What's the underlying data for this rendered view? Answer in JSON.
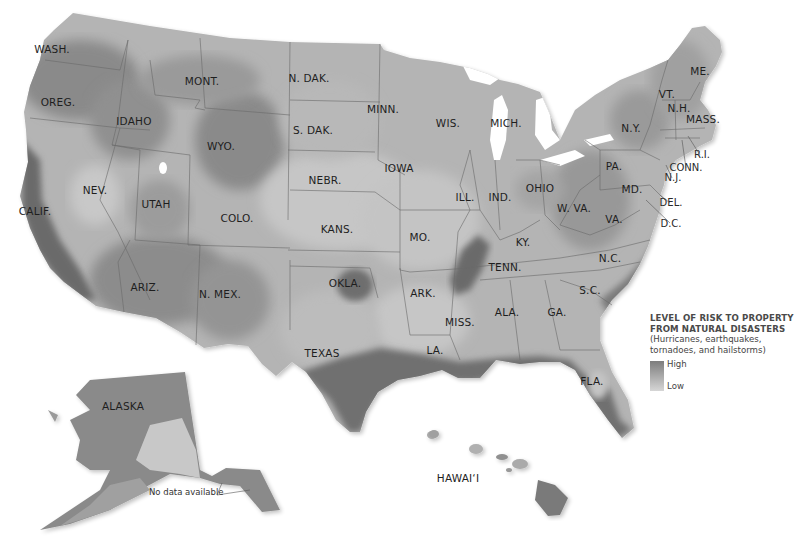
{
  "map": {
    "title": "Level of risk to property from natural disasters",
    "colors": {
      "high": "#6e6e6e",
      "mid": "#a6a6a6",
      "low": "#d8d8d8",
      "water": "#ffffff",
      "border": "#6a6a6a"
    },
    "states": [
      {
        "id": "wash",
        "label": "WASH.",
        "x": 52,
        "y": 53
      },
      {
        "id": "oreg",
        "label": "OREG.",
        "x": 58,
        "y": 106
      },
      {
        "id": "idaho",
        "label": "IDAHO",
        "x": 134,
        "y": 125
      },
      {
        "id": "mont",
        "label": "MONT.",
        "x": 202,
        "y": 85
      },
      {
        "id": "wyo",
        "label": "WYO.",
        "x": 221,
        "y": 150
      },
      {
        "id": "ndak",
        "label": "N. DAK.",
        "x": 309,
        "y": 82
      },
      {
        "id": "sdak",
        "label": "S. DAK.",
        "x": 313,
        "y": 134
      },
      {
        "id": "minn",
        "label": "MINN.",
        "x": 383,
        "y": 113
      },
      {
        "id": "wis",
        "label": "WIS.",
        "x": 448,
        "y": 127
      },
      {
        "id": "mich",
        "label": "MICH.",
        "x": 506,
        "y": 127
      },
      {
        "id": "nev",
        "label": "NEV.",
        "x": 95,
        "y": 194
      },
      {
        "id": "utah",
        "label": "UTAH",
        "x": 156,
        "y": 208
      },
      {
        "id": "calif",
        "label": "CALIF.",
        "x": 35,
        "y": 215
      },
      {
        "id": "colo",
        "label": "COLO.",
        "x": 237,
        "y": 222
      },
      {
        "id": "nebr",
        "label": "NEBR.",
        "x": 325,
        "y": 184
      },
      {
        "id": "iowa",
        "label": "IOWA",
        "x": 399,
        "y": 172
      },
      {
        "id": "kans",
        "label": "KANS.",
        "x": 337,
        "y": 233
      },
      {
        "id": "mo",
        "label": "MO.",
        "x": 420,
        "y": 241
      },
      {
        "id": "ill",
        "label": "ILL.",
        "x": 465,
        "y": 201
      },
      {
        "id": "ind",
        "label": "IND.",
        "x": 500,
        "y": 201
      },
      {
        "id": "ohio",
        "label": "OHIO",
        "x": 540,
        "y": 192
      },
      {
        "id": "ky",
        "label": "KY.",
        "x": 523,
        "y": 246
      },
      {
        "id": "tenn",
        "label": "TENN.",
        "x": 505,
        "y": 271
      },
      {
        "id": "okla",
        "label": "OKLA.",
        "x": 345,
        "y": 287
      },
      {
        "id": "ark",
        "label": "ARK.",
        "x": 423,
        "y": 297
      },
      {
        "id": "ariz",
        "label": "ARIZ.",
        "x": 145,
        "y": 291
      },
      {
        "id": "nmex",
        "label": "N. MEX.",
        "x": 220,
        "y": 298
      },
      {
        "id": "texas",
        "label": "TEXAS",
        "x": 322,
        "y": 357
      },
      {
        "id": "miss",
        "label": "MISS.",
        "x": 460,
        "y": 326
      },
      {
        "id": "ala",
        "label": "ALA.",
        "x": 507,
        "y": 316
      },
      {
        "id": "ga",
        "label": "GA.",
        "x": 557,
        "y": 316
      },
      {
        "id": "la",
        "label": "LA.",
        "x": 435,
        "y": 354
      },
      {
        "id": "fla",
        "label": "FLA.",
        "x": 592,
        "y": 385
      },
      {
        "id": "sc",
        "label": "S.C.",
        "x": 590,
        "y": 294
      },
      {
        "id": "nc",
        "label": "N.C.",
        "x": 610,
        "y": 262
      },
      {
        "id": "va",
        "label": "VA.",
        "x": 614,
        "y": 223
      },
      {
        "id": "wva",
        "label": "W. VA.",
        "x": 574,
        "y": 212
      },
      {
        "id": "pa",
        "label": "PA.",
        "x": 614,
        "y": 170
      },
      {
        "id": "ny",
        "label": "N.Y.",
        "x": 631,
        "y": 132
      },
      {
        "id": "vt",
        "label": "VT.",
        "x": 667,
        "y": 98
      },
      {
        "id": "nh",
        "label": "N.H.",
        "x": 679,
        "y": 112
      },
      {
        "id": "me",
        "label": "ME.",
        "x": 700,
        "y": 75
      },
      {
        "id": "mass",
        "label": "MASS.",
        "x": 703,
        "y": 123
      },
      {
        "id": "md",
        "label": "MD.",
        "x": 632,
        "y": 193
      },
      {
        "id": "alaska",
        "label": "ALASKA",
        "x": 123,
        "y": 410
      },
      {
        "id": "hawaii",
        "label": "HAWAI‘I",
        "x": 458,
        "y": 482
      }
    ],
    "callouts": [
      {
        "id": "ri",
        "label": "R.I.",
        "x": 702,
        "y": 158
      },
      {
        "id": "conn",
        "label": "CONN.",
        "x": 686,
        "y": 171
      },
      {
        "id": "nj",
        "label": "N.J.",
        "x": 673,
        "y": 181
      },
      {
        "id": "del",
        "label": "DEL.",
        "x": 671,
        "y": 206
      },
      {
        "id": "dc",
        "label": "D.C.",
        "x": 671,
        "y": 227
      }
    ],
    "note": "No data available"
  },
  "legend": {
    "title_line1": "LEVEL OF RISK TO PROPERTY",
    "title_line2": "FROM NATURAL DISASTERS",
    "sub_line1": "(Hurricanes, earthquakes,",
    "sub_line2": "tornadoes, and hailstorms)",
    "high_label": "High",
    "low_label": "Low"
  }
}
